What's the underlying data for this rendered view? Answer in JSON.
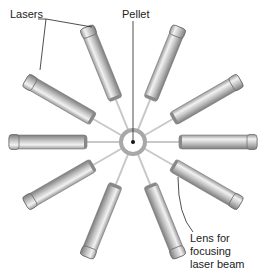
{
  "labels": {
    "lasers": "Lasers",
    "pellet": "Pellet",
    "lens_line1": "Lens for",
    "lens_line2": "focusing",
    "lens_line3": "laser beam"
  },
  "center": {
    "x": 133,
    "y": 142
  },
  "pellet": {
    "outer_r": 12,
    "inner_r": 9
  },
  "laser_angles_deg": [
    -112,
    -150,
    -68,
    -30,
    180,
    0,
    150,
    30,
    112,
    68
  ],
  "tube": {
    "r_start": 46,
    "r_end": 124,
    "width": 14
  },
  "colors": {
    "tube": "#bdbdbd",
    "tube_dark": "#8a8a8a",
    "beam": "#c8c8c8",
    "text": "#222222"
  }
}
